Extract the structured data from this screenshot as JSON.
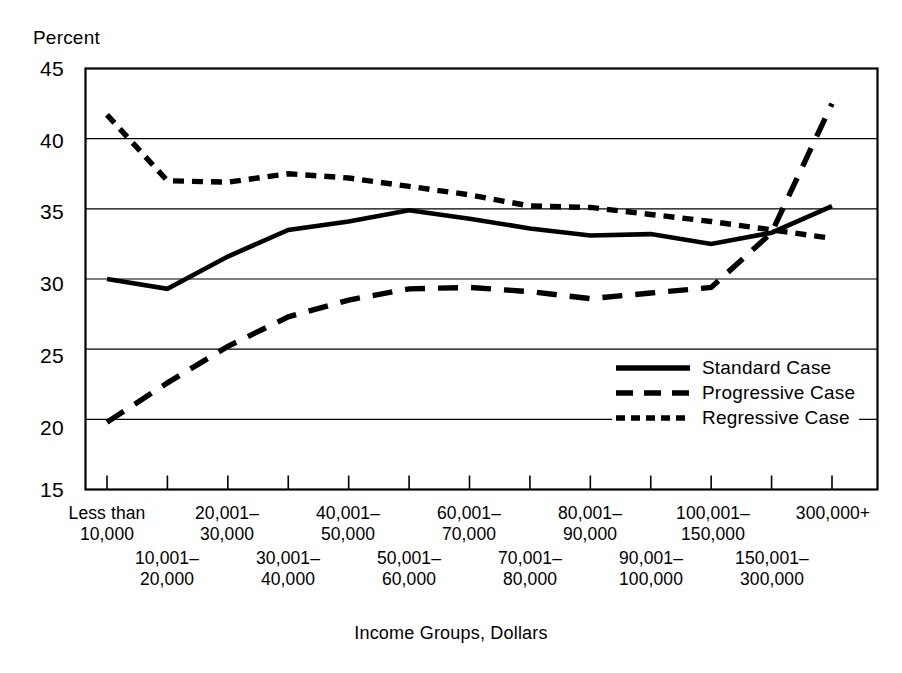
{
  "chart_data": {
    "type": "line",
    "title": "",
    "xlabel": "Income Groups, Dollars",
    "ylabel": "Percent",
    "ylim": [
      15,
      45
    ],
    "ytick_values": [
      45,
      40,
      35,
      30,
      25,
      20,
      15
    ],
    "ytick_labels": [
      "45",
      "40",
      "35",
      "30",
      "25",
      "20",
      "15"
    ],
    "grid": "horizontal",
    "legend_position": "inside-right-middle",
    "categories": [
      "Less than 10,000",
      "10,001–20,000",
      "20,001–30,000",
      "30,001–40,000",
      "40,001–50,000",
      "50,001–60,000",
      "60,001–70,000",
      "70,001–80,000",
      "80,001–90,000",
      "90,001–100,000",
      "100,001–150,000",
      "150,001–300,000",
      "300,000+"
    ],
    "xtick_labels_upper": [
      {
        "line1": "Less than",
        "line2": "10,000"
      },
      {
        "line1": "20,001–",
        "line2": "30,000"
      },
      {
        "line1": "40,001–",
        "line2": "50,000"
      },
      {
        "line1": "60,001–",
        "line2": "70,000"
      },
      {
        "line1": "80,001–",
        "line2": "90,000"
      },
      {
        "line1": "100,001–",
        "line2": "150,000"
      },
      {
        "line1": "300,000+",
        "line2": ""
      }
    ],
    "xtick_labels_lower": [
      {
        "line1": "10,001–",
        "line2": "20,000"
      },
      {
        "line1": "30,001–",
        "line2": "40,000"
      },
      {
        "line1": "50,001–",
        "line2": "60,000"
      },
      {
        "line1": "70,001–",
        "line2": "80,000"
      },
      {
        "line1": "90,001–",
        "line2": "100,000"
      },
      {
        "line1": "150,001–",
        "line2": "300,000"
      }
    ],
    "series": [
      {
        "name": "Standard Case",
        "style": "solid",
        "color": "#000000",
        "values": [
          30.0,
          29.3,
          31.6,
          33.5,
          34.1,
          34.9,
          34.3,
          33.6,
          33.1,
          33.2,
          32.5,
          33.3,
          35.2
        ]
      },
      {
        "name": "Progressive Case",
        "style": "dashed",
        "color": "#000000",
        "values": [
          19.8,
          22.6,
          25.2,
          27.3,
          28.5,
          29.3,
          29.4,
          29.1,
          28.6,
          29.0,
          29.4,
          33.3,
          42.5
        ]
      },
      {
        "name": "Regressive Case",
        "style": "dotted",
        "color": "#000000",
        "values": [
          41.7,
          37.0,
          36.9,
          37.5,
          37.2,
          36.6,
          36.0,
          35.2,
          35.1,
          34.6,
          34.1,
          33.5,
          32.9
        ]
      }
    ]
  },
  "legend": {
    "items": [
      {
        "label": "Standard Case",
        "style": "solid"
      },
      {
        "label": "Progressive Case",
        "style": "dashed"
      },
      {
        "label": "Regressive Case",
        "style": "dotted"
      }
    ]
  },
  "axes": {
    "y_title": "Percent",
    "x_title": "Income Groups, Dollars"
  }
}
